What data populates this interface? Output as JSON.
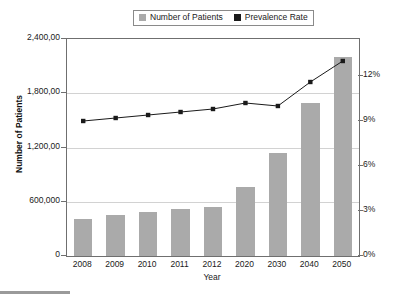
{
  "chart_data": {
    "type": "bar",
    "title": "",
    "xlabel": "Year",
    "ylabel": "Number of Patients",
    "ylabel_secondary": "",
    "grid": true,
    "legend_position": "top-center",
    "categories": [
      "2008",
      "2009",
      "2010",
      "2011",
      "2012",
      "2020",
      "2030",
      "2040",
      "2050"
    ],
    "ylim": [
      0,
      2400000
    ],
    "ylim_secondary": [
      0,
      0.135
    ],
    "ytick_labels": [
      "0",
      "600,000",
      "1,200,00",
      "1,800,00",
      "2,400,00"
    ],
    "ytick_values": [
      0,
      600000,
      1200000,
      1800000,
      2400000
    ],
    "ytick_labels_secondary": [
      "0%",
      "3%",
      "6%",
      "9%",
      "12%"
    ],
    "ytick_values_secondary": [
      0,
      3,
      6,
      9,
      12
    ],
    "series": [
      {
        "name": "Number of Patients",
        "type": "bar",
        "axis": "left",
        "color": "#aaaaaa",
        "values": [
          410000,
          450000,
          490000,
          520000,
          545000,
          760000,
          1140000,
          1690000,
          2200000
        ]
      },
      {
        "name": "Prevalence Rate",
        "type": "line",
        "axis": "right",
        "color": "#1a1a1a",
        "values": [
          9.0,
          9.2,
          9.4,
          9.6,
          9.8,
          10.2,
          10.0,
          11.6,
          13.0
        ]
      }
    ]
  },
  "legend": {
    "entries": [
      {
        "label": "Number of Patients",
        "color": "#aaaaaa"
      },
      {
        "label": "Prevalence Rate",
        "color": "#1a1a1a"
      }
    ]
  }
}
